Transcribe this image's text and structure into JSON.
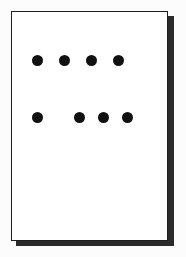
{
  "scene": {
    "background_color": "#fcfcfc",
    "width": 186,
    "height": 257
  },
  "card": {
    "label": "dot pattern card",
    "background_color": "#ffffff",
    "border_color": "#1d1d1d",
    "shadow_color": "#2b2b2b",
    "x": 11,
    "y": 11,
    "width": 157,
    "height": 230
  },
  "pattern": {
    "description": "two rows of filled black dots on a white card",
    "dot_color": "#111111",
    "dot_diameter": 11,
    "total_dots": 8,
    "rows": [
      {
        "name": "top-row",
        "y": 53,
        "dot_count": 4,
        "cells": [
          {
            "filled": true,
            "x": 20
          },
          {
            "filled": true,
            "x": 47
          },
          {
            "filled": true,
            "x": 74
          },
          {
            "filled": true,
            "x": 101
          }
        ]
      },
      {
        "name": "bottom-row",
        "y": 110,
        "dot_count": 4,
        "cells": [
          {
            "filled": true,
            "x": 20
          },
          {
            "filled": false,
            "x": 47
          },
          {
            "filled": true,
            "x": 62
          },
          {
            "filled": true,
            "x": 86
          },
          {
            "filled": true,
            "x": 110
          }
        ]
      }
    ]
  }
}
